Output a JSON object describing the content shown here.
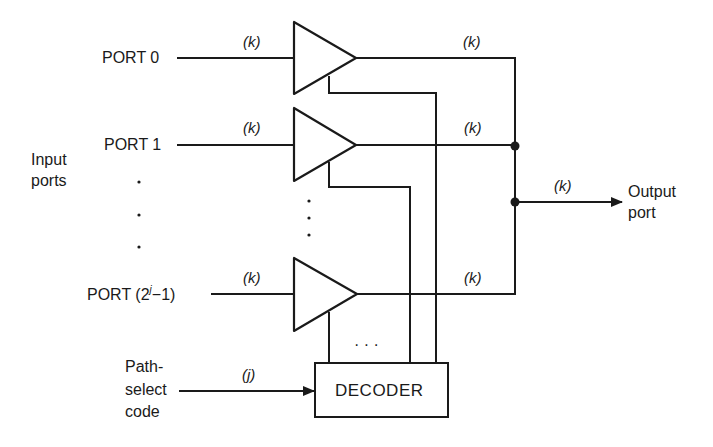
{
  "diagram": {
    "type": "multiplexer-block-diagram",
    "inputs": {
      "group_label_line1": "Input",
      "group_label_line2": "ports",
      "ports": [
        {
          "label": "PORT 0",
          "width_label": "(k)"
        },
        {
          "label": "PORT 1",
          "width_label": "(k)"
        },
        {
          "label_prefix": "PORT (2",
          "label_sup": "j",
          "label_suffix": "−1)",
          "width_label": "(k)"
        }
      ],
      "ellipsis": "·"
    },
    "buffers": [
      {
        "output_width_label": "(k)"
      },
      {
        "output_width_label": "(k)"
      },
      {
        "output_width_label": "(k)"
      }
    ],
    "output": {
      "width_label": "(k)",
      "label_line1": "Output",
      "label_line2": "port"
    },
    "decoder": {
      "label": "DECODER",
      "control_ellipsis": "· · ·"
    },
    "select": {
      "label_line1": "Path-",
      "label_line2": "select",
      "label_line3": "code",
      "width_label": "(j)"
    },
    "colors": {
      "line": "#1a1a1a",
      "background": "#ffffff"
    }
  }
}
